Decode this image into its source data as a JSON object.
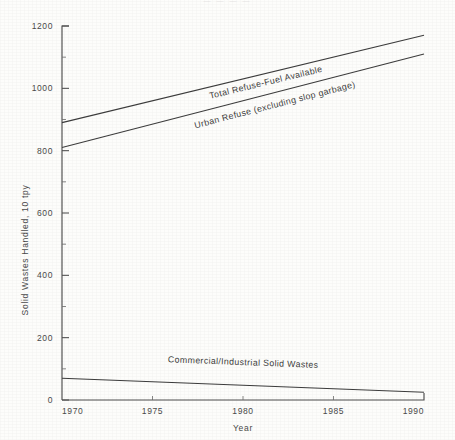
{
  "page": {
    "top_fragment": "— — — —"
  },
  "chart_data": {
    "type": "line",
    "title": "",
    "xlabel": "Year",
    "ylabel": "Solid Wastes Handled, 10 tpy",
    "xlim": [
      1970,
      1990
    ],
    "ylim": [
      0,
      1200
    ],
    "grid": false,
    "legend_position": "inline-annotations",
    "x": [
      1970,
      1990
    ],
    "xticks": [
      1970,
      1975,
      1980,
      1985,
      1990
    ],
    "xtick_labels": [
      "1970",
      "1975",
      "1980",
      "1985",
      "1990"
    ],
    "yticks": [
      0,
      200,
      400,
      600,
      800,
      1000,
      1200
    ],
    "ytick_labels": [
      "0",
      "200",
      "400",
      "600",
      "800",
      "1000",
      "1200"
    ],
    "yticks_minor": [
      100,
      300,
      500,
      700,
      900,
      1100
    ],
    "series": [
      {
        "name": "Total Refuse-Fuel Available",
        "values": [
          890,
          1170
        ],
        "label_x": 1981.3,
        "label_y": 1010
      },
      {
        "name": "Urban Refuse  (excluding slop garbage)",
        "values": [
          810,
          1110
        ],
        "label_x": 1981.8,
        "label_y": 938
      },
      {
        "name": "Commercial/Industrial Solid Wastes",
        "values": [
          70,
          25
        ],
        "label_x": 1980.0,
        "label_y": 112
      }
    ]
  }
}
